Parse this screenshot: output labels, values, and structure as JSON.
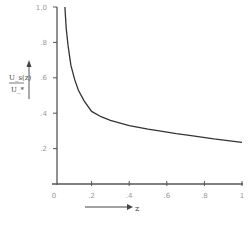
{
  "chart_data": {
    "type": "line",
    "title": "",
    "xlabel": "z",
    "ylabel": "U_s(z)/U_*",
    "ylabel_num": "U_s(z)",
    "ylabel_den": "U_*",
    "xlim": [
      0,
      1
    ],
    "ylim": [
      0,
      1.0
    ],
    "x_ticks": [
      0,
      0.2,
      0.4,
      0.6,
      0.8,
      1
    ],
    "x_tick_labels": [
      "0",
      ".2",
      ".4",
      ".6",
      ".8",
      "1"
    ],
    "y_ticks": [
      0.2,
      0.4,
      0.6,
      0.8,
      1.0
    ],
    "y_tick_labels": [
      ".2",
      ".4",
      ".6",
      ".8",
      "1.0"
    ],
    "grid": false,
    "legend": null,
    "series": [
      {
        "name": "U_s(z)/U_*",
        "x": [
          0.058,
          0.065,
          0.075,
          0.09,
          0.11,
          0.13,
          0.16,
          0.2,
          0.25,
          0.3,
          0.4,
          0.5,
          0.56,
          0.65,
          0.72,
          0.85,
          1.0
        ],
        "y": [
          1.0,
          0.88,
          0.78,
          0.67,
          0.59,
          0.53,
          0.47,
          0.41,
          0.38,
          0.36,
          0.33,
          0.31,
          0.3,
          0.285,
          0.275,
          0.255,
          0.235
        ]
      }
    ],
    "colors": {
      "axis": "#555555",
      "line": "#333333",
      "ticks_text": "#9a9a9a"
    }
  }
}
